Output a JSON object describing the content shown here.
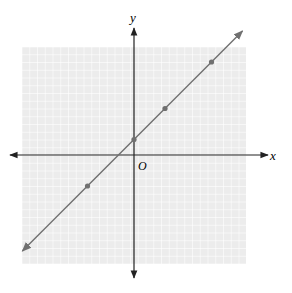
{
  "labels": {
    "x_axis": "x",
    "y_axis": "y",
    "origin": "O"
  },
  "colors": {
    "grid_bg": "#ececec",
    "grid_line": "#ffffff",
    "axis": "#222222",
    "line": "#707070",
    "point": "#707070"
  },
  "chart_data": {
    "type": "line",
    "title": "",
    "xlabel": "x",
    "ylabel": "y",
    "xlim": [
      -7,
      7
    ],
    "ylim": [
      -7,
      7
    ],
    "grid": true,
    "equation": "y = x + 1",
    "series": [
      {
        "name": "line",
        "x": [
          -3,
          0,
          2,
          5
        ],
        "y": [
          -2,
          1,
          3,
          6
        ]
      }
    ],
    "points": [
      [
        -3,
        -2
      ],
      [
        0,
        1
      ],
      [
        2,
        3
      ],
      [
        5,
        6
      ]
    ],
    "annotations": [
      "O"
    ]
  }
}
